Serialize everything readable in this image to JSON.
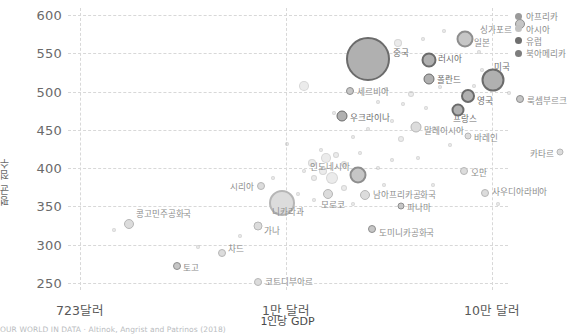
{
  "chart_data": {
    "type": "scatter",
    "title": "",
    "xlabel": "1인당 GDP",
    "ylabel": "평균 점수",
    "xscale": "log",
    "xticks": [
      "723달러",
      "1만 달러",
      "10만 달러"
    ],
    "yticks": [
      "600",
      "550",
      "500",
      "450",
      "400",
      "350",
      "300",
      "250"
    ],
    "ylim": [
      235,
      615
    ],
    "grid": true,
    "legend_position": "top-right",
    "legend": [
      {
        "label": "아프리카",
        "color": "#9a9a9a"
      },
      {
        "label": "아시아",
        "color": "#c2c2c2"
      },
      {
        "label": "유럽",
        "color": "#6f6f6f"
      },
      {
        "label": "북아메리카",
        "color": "#7d7d7d"
      }
    ],
    "points": [
      {
        "name": "싱가포르",
        "x": 452,
        "y": 16,
        "r": 5,
        "group": "아시아",
        "lx": 444,
        "ly": 21,
        "align": "r",
        "tone": "mid"
      },
      {
        "name": "일본",
        "x": 397,
        "y": 31,
        "r": 8.5,
        "group": "아시아",
        "lx": 406,
        "ly": 34,
        "align": "l",
        "tone": "mid"
      },
      {
        "name": "중국",
        "x": 300,
        "y": 51,
        "r": 22,
        "group": "아시아",
        "lx": 325,
        "ly": 44,
        "align": "l",
        "tone": "dark"
      },
      {
        "name": "러시아",
        "x": 361,
        "y": 52,
        "r": 7.5,
        "group": "유럽",
        "lx": 370,
        "ly": 50,
        "align": "l",
        "tone": "dark"
      },
      {
        "name": "미국",
        "x": 425,
        "y": 72,
        "r": 11.5,
        "group": "북아메리카",
        "lx": 426,
        "ly": 58,
        "align": "l",
        "tone": "dark"
      },
      {
        "name": "폴란드",
        "x": 361,
        "y": 71,
        "r": 5.5,
        "group": "유럽",
        "lx": 369,
        "ly": 71,
        "align": "l",
        "tone": "dark"
      },
      {
        "name": "룩셈부르크",
        "x": 452,
        "y": 91,
        "r": 4,
        "group": "유럽",
        "lx": 459,
        "ly": 92,
        "align": "l",
        "tone": "mid"
      },
      {
        "name": "영국",
        "x": 400,
        "y": 88,
        "r": 7,
        "group": "유럽",
        "lx": 409,
        "ly": 92,
        "align": "l",
        "tone": "dark"
      },
      {
        "name": "프랑스",
        "x": 390,
        "y": 102,
        "r": 6.5,
        "group": "유럽",
        "lx": 385,
        "ly": 110,
        "align": "l",
        "tone": "dark"
      },
      {
        "name": "세르비아",
        "x": 282,
        "y": 83,
        "r": 4,
        "group": "유럽",
        "lx": 289,
        "ly": 83,
        "align": "l",
        "tone": "mid"
      },
      {
        "name": "우크라이나",
        "x": 274,
        "y": 108,
        "r": 5.5,
        "group": "유럽",
        "lx": 282,
        "ly": 109,
        "align": "l",
        "tone": "dark"
      },
      {
        "name": "말레이시아",
        "x": 348,
        "y": 119,
        "r": 5.5,
        "group": "아시아",
        "lx": 356,
        "ly": 122,
        "align": "l",
        "tone": "light"
      },
      {
        "name": "바레인",
        "x": 400,
        "y": 128,
        "r": 3.5,
        "group": "아시아",
        "lx": 406,
        "ly": 129,
        "align": "l",
        "tone": "light"
      },
      {
        "name": "카타르",
        "x": 492,
        "y": 144,
        "r": 3.5,
        "group": "아시아",
        "lx": 486,
        "ly": 145,
        "align": "r",
        "tone": "light"
      },
      {
        "name": "인도네시아",
        "x": 290,
        "y": 167,
        "r": 8.5,
        "group": "아시아",
        "lx": 282,
        "ly": 158,
        "align": "r",
        "tone": "mid"
      },
      {
        "name": "오만",
        "x": 396,
        "y": 163,
        "r": 4,
        "group": "아시아",
        "lx": 403,
        "ly": 164,
        "align": "l",
        "tone": "light"
      },
      {
        "name": "시리아",
        "x": 193,
        "y": 178,
        "r": 4,
        "group": "아시아",
        "lx": 186,
        "ly": 178,
        "align": "r",
        "tone": "light"
      },
      {
        "name": "니카라과",
        "x": 214,
        "y": 195,
        "r": 13,
        "group": "북아메리카",
        "lx": 204,
        "ly": 203,
        "align": "l",
        "tone": "light"
      },
      {
        "name": "모로코",
        "x": 260,
        "y": 186,
        "r": 5,
        "group": "아프리카",
        "lx": 253,
        "ly": 196,
        "align": "l",
        "tone": "light"
      },
      {
        "name": "남아프리카공화국",
        "x": 297,
        "y": 187,
        "r": 5,
        "group": "아프리카",
        "lx": 305,
        "ly": 186,
        "align": "l",
        "tone": "light"
      },
      {
        "name": "사우디아라비아",
        "x": 417,
        "y": 185,
        "r": 4,
        "group": "아시아",
        "lx": 424,
        "ly": 183,
        "align": "l",
        "tone": "light"
      },
      {
        "name": "파나마",
        "x": 333,
        "y": 198,
        "r": 3.5,
        "group": "북아메리카",
        "lx": 339,
        "ly": 199,
        "align": "l",
        "tone": "mid"
      },
      {
        "name": "콩고민주공화국",
        "x": 61,
        "y": 216,
        "r": 5,
        "group": "아프리카",
        "lx": 68,
        "ly": 205,
        "align": "l",
        "tone": "light"
      },
      {
        "name": "가나",
        "x": 190,
        "y": 218,
        "r": 4.5,
        "group": "아프리카",
        "lx": 196,
        "ly": 222,
        "align": "l",
        "tone": "light"
      },
      {
        "name": "도미니카공화국",
        "x": 304,
        "y": 221,
        "r": 4,
        "group": "북아메리카",
        "lx": 311,
        "ly": 224,
        "align": "l",
        "tone": "mid"
      },
      {
        "name": "차드",
        "x": 154,
        "y": 245,
        "r": 4,
        "group": "아프리카",
        "lx": 160,
        "ly": 240,
        "align": "l",
        "tone": "light"
      },
      {
        "name": "토고",
        "x": 109,
        "y": 258,
        "r": 4,
        "group": "아프리카",
        "lx": 115,
        "ly": 259,
        "align": "l",
        "tone": "mid"
      },
      {
        "name": "코트디부아르",
        "x": 190,
        "y": 274,
        "r": 4,
        "group": "아프리카",
        "lx": 197,
        "ly": 273,
        "align": "l",
        "tone": "light"
      }
    ],
    "faint_points": [
      {
        "x": 330,
        "y": 35,
        "r": 4
      },
      {
        "x": 355,
        "y": 31,
        "r": 2
      },
      {
        "x": 376,
        "y": 23,
        "r": 2
      },
      {
        "x": 411,
        "y": 44,
        "r": 2
      },
      {
        "x": 236,
        "y": 78,
        "r": 5
      },
      {
        "x": 266,
        "y": 105,
        "r": 2
      },
      {
        "x": 310,
        "y": 94,
        "r": 2
      },
      {
        "x": 318,
        "y": 81,
        "r": 2
      },
      {
        "x": 335,
        "y": 96,
        "r": 2
      },
      {
        "x": 343,
        "y": 86,
        "r": 3
      },
      {
        "x": 358,
        "y": 100,
        "r": 2
      },
      {
        "x": 372,
        "y": 79,
        "r": 2
      },
      {
        "x": 380,
        "y": 69,
        "r": 2
      },
      {
        "x": 414,
        "y": 62,
        "r": 2
      },
      {
        "x": 406,
        "y": 78,
        "r": 2
      },
      {
        "x": 441,
        "y": 85,
        "r": 2
      },
      {
        "x": 285,
        "y": 129,
        "r": 2
      },
      {
        "x": 300,
        "y": 121,
        "r": 2
      },
      {
        "x": 324,
        "y": 113,
        "r": 2
      },
      {
        "x": 333,
        "y": 131,
        "r": 3
      },
      {
        "x": 366,
        "y": 120,
        "r": 2
      },
      {
        "x": 382,
        "y": 137,
        "r": 2
      },
      {
        "x": 253,
        "y": 142,
        "r": 2
      },
      {
        "x": 219,
        "y": 136,
        "r": 2
      },
      {
        "x": 244,
        "y": 155,
        "r": 4
      },
      {
        "x": 258,
        "y": 150,
        "r": 5
      },
      {
        "x": 268,
        "y": 147,
        "r": 3
      },
      {
        "x": 276,
        "y": 156,
        "r": 3
      },
      {
        "x": 255,
        "y": 163,
        "r": 4
      },
      {
        "x": 264,
        "y": 170,
        "r": 6
      },
      {
        "x": 246,
        "y": 170,
        "r": 3
      },
      {
        "x": 236,
        "y": 163,
        "r": 2
      },
      {
        "x": 310,
        "y": 160,
        "r": 2
      },
      {
        "x": 324,
        "y": 152,
        "r": 2
      },
      {
        "x": 350,
        "y": 150,
        "r": 2
      },
      {
        "x": 230,
        "y": 186,
        "r": 2
      },
      {
        "x": 246,
        "y": 192,
        "r": 2
      },
      {
        "x": 276,
        "y": 180,
        "r": 3
      },
      {
        "x": 285,
        "y": 196,
        "r": 2
      },
      {
        "x": 316,
        "y": 177,
        "r": 2
      },
      {
        "x": 365,
        "y": 177,
        "r": 2
      },
      {
        "x": 430,
        "y": 196,
        "r": 2
      },
      {
        "x": 46,
        "y": 222,
        "r": 2
      },
      {
        "x": 130,
        "y": 239,
        "r": 2
      },
      {
        "x": 172,
        "y": 228,
        "r": 2
      },
      {
        "x": 205,
        "y": 170,
        "r": 2
      },
      {
        "x": 292,
        "y": 145,
        "r": 2
      }
    ]
  },
  "footer": {
    "source": "OUR WORLD IN DATA · Altinok, Angrist and Patrinos (2018)"
  }
}
